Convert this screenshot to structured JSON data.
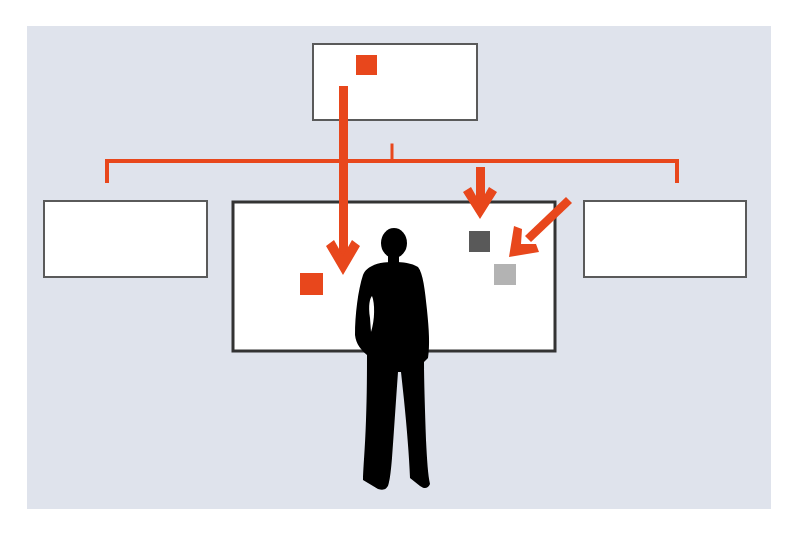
{
  "diagram": {
    "colors": {
      "background": "#dfe3ec",
      "panel_fill": "#ffffff",
      "panel_border": "#5a5a5a",
      "center_border": "#333333",
      "accent": "#e8471c",
      "item_dark": "#595959",
      "item_light": "#b3b3b3",
      "silhouette": "#000000"
    },
    "panels": [
      {
        "id": "top-source-panel",
        "x": 313,
        "y": 44,
        "w": 164,
        "h": 76
      },
      {
        "id": "left-panel",
        "x": 44,
        "y": 201,
        "w": 163,
        "h": 76
      },
      {
        "id": "center-board",
        "x": 232,
        "y": 201,
        "w": 324,
        "h": 151
      },
      {
        "id": "right-panel",
        "x": 584,
        "y": 201,
        "w": 162,
        "h": 76
      }
    ],
    "items": [
      {
        "id": "source-item",
        "color": "accent",
        "x": 356,
        "y": 55,
        "size": 21
      },
      {
        "id": "placed-item-orange",
        "color": "accent",
        "x": 300,
        "y": 273,
        "size": 22
      },
      {
        "id": "placed-item-dark",
        "color": "item_dark",
        "x": 469,
        "y": 231,
        "size": 21
      },
      {
        "id": "placed-item-light",
        "color": "item_light",
        "x": 494,
        "y": 264,
        "size": 21
      }
    ],
    "connectors": {
      "bracket": {
        "x1": 107,
        "x2": 677,
        "y": 161,
        "leg_bottom": 182,
        "tick_x": 392,
        "tick_top": 143
      },
      "arrows": [
        {
          "id": "main-down-arrow",
          "from": [
            343,
            86
          ],
          "to": [
            343,
            274
          ]
        },
        {
          "id": "short-down-arrow",
          "from": [
            480,
            167
          ],
          "to": [
            480,
            219
          ]
        },
        {
          "id": "diagonal-arrow",
          "from": [
            569,
            200
          ],
          "to": [
            510,
            256
          ]
        }
      ]
    }
  }
}
